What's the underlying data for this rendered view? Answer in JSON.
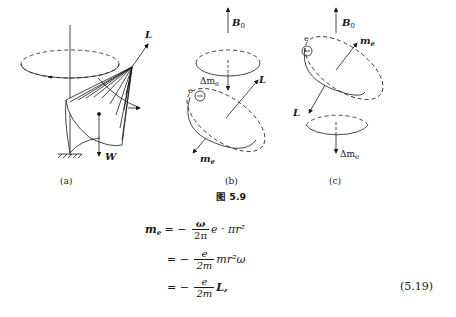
{
  "figure": {
    "title": "图 5.9",
    "panels": [
      {
        "id": "a",
        "caption": "(a)",
        "labels": {
          "angular_momentum": "L",
          "weight": "W"
        }
      },
      {
        "id": "b",
        "caption": "(b)",
        "labels": {
          "field": "B",
          "field_sub": "0",
          "angular_momentum": "L",
          "electron": "e",
          "delta_moment": "Δm",
          "delta_sub": "e",
          "moment": "m",
          "moment_sub": "e"
        }
      },
      {
        "id": "c",
        "caption": "(c)",
        "labels": {
          "field": "B",
          "field_sub": "0",
          "angular_momentum": "L",
          "electron": "e",
          "delta_moment": "Δm",
          "delta_sub": "e",
          "moment": "m",
          "moment_sub": "e"
        }
      }
    ]
  },
  "equation": {
    "lhs": "m",
    "lhs_sub": "e",
    "line1": {
      "eq": "= −",
      "num": "ω",
      "den": "2π",
      "rest": "e · πr²"
    },
    "line2": {
      "eq": "= −",
      "num": "e",
      "den": "2m",
      "rest": "mr²ω"
    },
    "line3": {
      "eq": "= −",
      "num": "e",
      "den": "2m",
      "rest": "L,"
    },
    "number": "(5.19)"
  }
}
